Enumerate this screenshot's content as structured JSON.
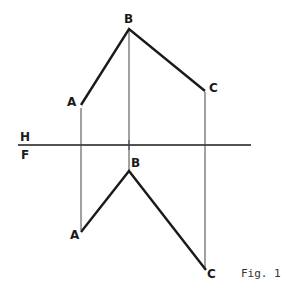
{
  "figure": {
    "caption": "Fig. 1",
    "planes": {
      "upper": "H",
      "lower": "F"
    },
    "top_view": {
      "points": [
        {
          "label": "A",
          "x": 81,
          "y": 105
        },
        {
          "label": "B",
          "x": 129,
          "y": 29
        },
        {
          "label": "C",
          "x": 205,
          "y": 91
        }
      ]
    },
    "front_view": {
      "points": [
        {
          "label": "A",
          "x": 81,
          "y": 232
        },
        {
          "label": "B",
          "x": 129,
          "y": 171
        },
        {
          "label": "C",
          "x": 206,
          "y": 270
        }
      ]
    },
    "colors": {
      "line": "#1a1a1a",
      "projector": "#444444"
    }
  }
}
